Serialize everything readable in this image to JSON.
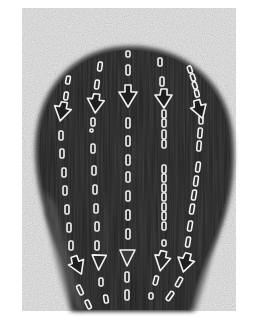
{
  "figure": {
    "colors": {
      "page_bg": "#ffffff",
      "backdrop": "#ececec",
      "hair_dark": "#3e3e3e",
      "hair_mid": "#555555",
      "hair_edge": "#7a7a7a",
      "guide_stroke": "#f2f2f2",
      "arrow_fill": "#1e1e1e"
    },
    "guide_lines": [
      {
        "id": 1,
        "points": [
          [
            69,
            76
          ],
          [
            64,
            108
          ],
          [
            63,
            150
          ],
          [
            66,
            200
          ],
          [
            70,
            240
          ],
          [
            74,
            262
          ],
          [
            82,
            290
          ],
          [
            90,
            314
          ]
        ],
        "arrows": [
          [
            62,
            112
          ],
          [
            77,
            265
          ]
        ]
      },
      {
        "id": 2,
        "points": [
          [
            100,
            66
          ],
          [
            97,
            95
          ],
          [
            94,
            130
          ],
          [
            94,
            170
          ],
          [
            96,
            215
          ],
          [
            97,
            245
          ],
          [
            100,
            275
          ],
          [
            106,
            302
          ]
        ],
        "arrows": [
          [
            95,
            102
          ],
          [
            97,
            266
          ]
        ]
      },
      {
        "id": 3,
        "points": [
          [
            128,
            52
          ],
          [
            128,
            75
          ],
          [
            128,
            130
          ],
          [
            128,
            190
          ],
          [
            128,
            240
          ],
          [
            127,
            280
          ],
          [
            127,
            300
          ]
        ],
        "arrows": [
          [
            128,
            95
          ],
          [
            127,
            258
          ]
        ]
      },
      {
        "id": 4,
        "points": [
          [
            159,
            62
          ],
          [
            162,
            85
          ],
          [
            164,
            130
          ],
          [
            164,
            180
          ],
          [
            163,
            225
          ],
          [
            162,
            248
          ],
          [
            157,
            282
          ],
          [
            152,
            298
          ]
        ],
        "arrows": [
          [
            164,
            98
          ],
          [
            162,
            260
          ]
        ]
      },
      {
        "id": 5,
        "points": [
          [
            190,
            68
          ],
          [
            195,
            88
          ],
          [
            200,
            120
          ],
          [
            199,
            160
          ],
          [
            196,
            205
          ],
          [
            192,
            240
          ],
          [
            184,
            275
          ],
          [
            171,
            302
          ]
        ],
        "arrows": [
          [
            199,
            110
          ],
          [
            185,
            263
          ]
        ]
      }
    ],
    "arrow_count": 10,
    "line_count": 5
  }
}
